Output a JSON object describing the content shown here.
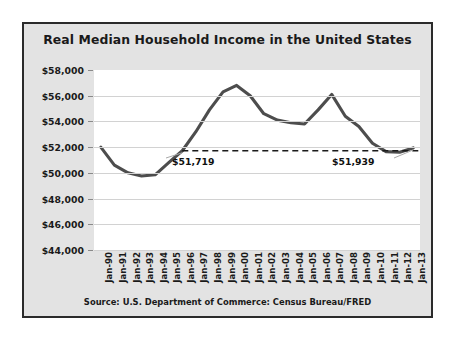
{
  "chart_data": {
    "type": "line",
    "title": "Real Median Household Income in the United States",
    "source": "Source: U.S. Department of Commerce: Census Bureau/FRED",
    "xlabel": "",
    "ylabel": "",
    "ylim": [
      44000,
      58000
    ],
    "ytick_step": 2000,
    "grid": true,
    "legend": "none",
    "line_color": "#4d4d4d",
    "plot_background": "#ffffff",
    "panel_background": "#e3e3e3",
    "ytick_labels": [
      "$58,000",
      "$56,000",
      "$54,000",
      "$52,000",
      "$50,000",
      "$48,000",
      "$46,000",
      "$44,000"
    ],
    "ytick_values": [
      58000,
      56000,
      54000,
      52000,
      50000,
      48000,
      46000,
      44000
    ],
    "categories": [
      "Jan-90",
      "Jan-91",
      "Jan-92",
      "Jan-93",
      "Jan-94",
      "Jan-95",
      "Jan-96",
      "Jan-97",
      "Jan-98",
      "Jan-99",
      "Jan-00",
      "Jan-01",
      "Jan-02",
      "Jan-03",
      "Jan-04",
      "Jan-05",
      "Jan-06",
      "Jan-07",
      "Jan-08",
      "Jan-09",
      "Jan-10",
      "Jan-11",
      "Jan-12",
      "Jan-13"
    ],
    "values": [
      52000,
      50600,
      50000,
      49750,
      49850,
      50800,
      51719,
      53200,
      54900,
      56300,
      56800,
      56000,
      54600,
      54100,
      53900,
      53800,
      54900,
      56100,
      54400,
      53600,
      52300,
      51650,
      51600,
      51939
    ],
    "annotations": [
      {
        "label": "$51,719",
        "category": "Jan-96",
        "value": 51719,
        "note": "reference level marked by dashed horizontal line"
      },
      {
        "label": "$51,939",
        "category": "Jan-13",
        "value": 51939,
        "note": "end-of-series value"
      }
    ],
    "reference_line": {
      "value": 51719,
      "style": "dashed",
      "color": "#1a1a1a",
      "from_category": "Jan-96",
      "to_category": "Jan-13"
    }
  }
}
